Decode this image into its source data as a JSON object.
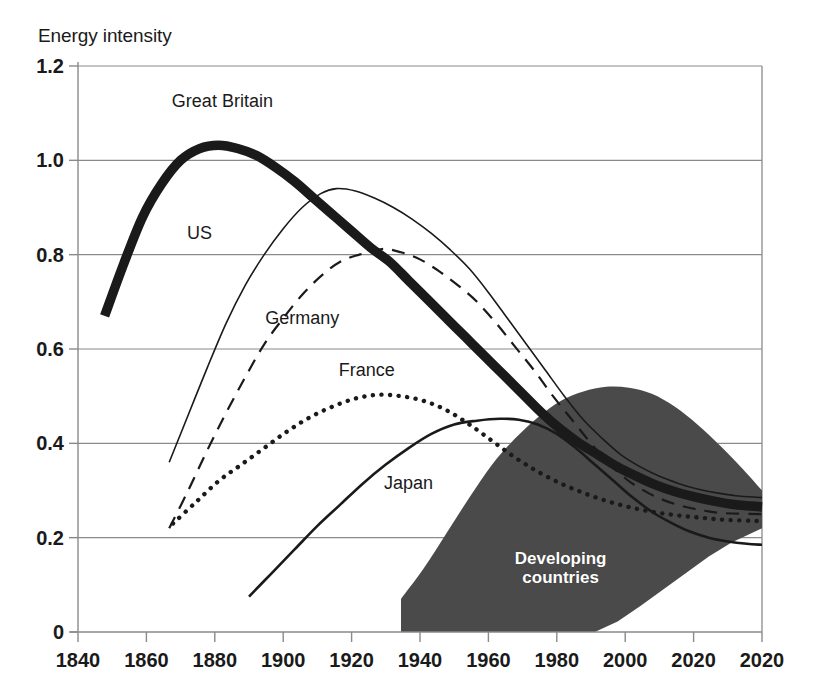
{
  "axes": {
    "y_axis_title": "Energy intensity",
    "y_ticks": [
      "1.2",
      "1.0",
      "0.8",
      "0.6",
      "0.4",
      "0.2",
      "0"
    ],
    "x_ticks": [
      "1840",
      "1860",
      "1880",
      "1900",
      "1920",
      "1940",
      "1960",
      "1980",
      "2000",
      "2020",
      "2020"
    ]
  },
  "labels": {
    "great_britain": "Great Britain",
    "us": "US",
    "germany": "Germany",
    "france": "France",
    "japan": "Japan",
    "developing": "Developing\ncountries"
  },
  "colors": {
    "ink": "#1a1a1a",
    "grid": "#8a8a8a",
    "band_fill": "#4a4a4a",
    "background": "#ffffff"
  },
  "chart_data": {
    "type": "line",
    "title": "",
    "subtitle": "",
    "xlabel": "",
    "ylabel": "Energy intensity",
    "xlim": [
      1840,
      2020
    ],
    "ylim": [
      0,
      1.2
    ],
    "grid": true,
    "legend_position": "inline-annotations",
    "x_ticks": [
      1840,
      1860,
      1880,
      1900,
      1920,
      1940,
      1960,
      1980,
      2000,
      2020,
      2020
    ],
    "y_ticks": [
      1.2,
      1.0,
      0.8,
      0.6,
      0.4,
      0.2,
      0
    ],
    "series": [
      {
        "name": "Great Britain",
        "style": "thick-solid",
        "label_x": 1878,
        "label_y": 1.125,
        "points": [
          [
            1847,
            0.67
          ],
          [
            1852,
            0.78
          ],
          [
            1857,
            0.88
          ],
          [
            1862,
            0.95
          ],
          [
            1867,
            1.0
          ],
          [
            1872,
            1.025
          ],
          [
            1877,
            1.032
          ],
          [
            1882,
            1.025
          ],
          [
            1887,
            1.01
          ],
          [
            1892,
            0.985
          ],
          [
            1897,
            0.955
          ],
          [
            1902,
            0.92
          ],
          [
            1907,
            0.885
          ],
          [
            1912,
            0.85
          ],
          [
            1917,
            0.815
          ],
          [
            1922,
            0.785
          ],
          [
            1927,
            0.745
          ],
          [
            1932,
            0.705
          ],
          [
            1937,
            0.665
          ],
          [
            1942,
            0.625
          ],
          [
            1947,
            0.585
          ],
          [
            1952,
            0.545
          ],
          [
            1957,
            0.505
          ],
          [
            1962,
            0.465
          ],
          [
            1967,
            0.43
          ],
          [
            1972,
            0.4
          ],
          [
            1977,
            0.375
          ],
          [
            1982,
            0.35
          ],
          [
            1987,
            0.33
          ],
          [
            1992,
            0.312
          ],
          [
            1997,
            0.298
          ],
          [
            2002,
            0.287
          ],
          [
            2007,
            0.278
          ],
          [
            2012,
            0.271
          ],
          [
            2017,
            0.267
          ],
          [
            2020,
            0.265
          ]
        ]
      },
      {
        "name": "US",
        "style": "thin-solid",
        "label_x": 1872,
        "label_y": 0.845,
        "points": [
          [
            1864,
            0.36
          ],
          [
            1869,
            0.46
          ],
          [
            1874,
            0.56
          ],
          [
            1879,
            0.655
          ],
          [
            1884,
            0.735
          ],
          [
            1889,
            0.8
          ],
          [
            1894,
            0.855
          ],
          [
            1899,
            0.9
          ],
          [
            1904,
            0.93
          ],
          [
            1908,
            0.94
          ],
          [
            1913,
            0.935
          ],
          [
            1918,
            0.92
          ],
          [
            1923,
            0.9
          ],
          [
            1928,
            0.875
          ],
          [
            1933,
            0.845
          ],
          [
            1938,
            0.81
          ],
          [
            1943,
            0.77
          ],
          [
            1948,
            0.72
          ],
          [
            1953,
            0.665
          ],
          [
            1958,
            0.61
          ],
          [
            1963,
            0.555
          ],
          [
            1968,
            0.5
          ],
          [
            1973,
            0.45
          ],
          [
            1978,
            0.41
          ],
          [
            1983,
            0.375
          ],
          [
            1988,
            0.35
          ],
          [
            1993,
            0.33
          ],
          [
            1998,
            0.315
          ],
          [
            2003,
            0.303
          ],
          [
            2008,
            0.295
          ],
          [
            2013,
            0.289
          ],
          [
            2020,
            0.285
          ]
        ]
      },
      {
        "name": "Germany",
        "style": "dashed",
        "label_x": 1899,
        "label_y": 0.665,
        "points": [
          [
            1864,
            0.22
          ],
          [
            1869,
            0.3
          ],
          [
            1874,
            0.385
          ],
          [
            1879,
            0.465
          ],
          [
            1884,
            0.54
          ],
          [
            1889,
            0.61
          ],
          [
            1894,
            0.665
          ],
          [
            1899,
            0.715
          ],
          [
            1904,
            0.755
          ],
          [
            1909,
            0.785
          ],
          [
            1914,
            0.8
          ],
          [
            1920,
            0.812
          ],
          [
            1925,
            0.805
          ],
          [
            1930,
            0.79
          ],
          [
            1935,
            0.765
          ],
          [
            1940,
            0.735
          ],
          [
            1945,
            0.7
          ],
          [
            1950,
            0.655
          ],
          [
            1955,
            0.605
          ],
          [
            1960,
            0.555
          ],
          [
            1965,
            0.5
          ],
          [
            1970,
            0.45
          ],
          [
            1975,
            0.4
          ],
          [
            1980,
            0.355
          ],
          [
            1985,
            0.32
          ],
          [
            1990,
            0.295
          ],
          [
            1995,
            0.277
          ],
          [
            2000,
            0.265
          ],
          [
            2005,
            0.257
          ],
          [
            2010,
            0.252
          ],
          [
            2020,
            0.25
          ]
        ]
      },
      {
        "name": "France",
        "style": "dotted",
        "label_x": 1916,
        "label_y": 0.555,
        "points": [
          [
            1865,
            0.23
          ],
          [
            1871,
            0.275
          ],
          [
            1877,
            0.32
          ],
          [
            1883,
            0.355
          ],
          [
            1889,
            0.39
          ],
          [
            1895,
            0.425
          ],
          [
            1901,
            0.455
          ],
          [
            1907,
            0.478
          ],
          [
            1913,
            0.495
          ],
          [
            1919,
            0.503
          ],
          [
            1925,
            0.5
          ],
          [
            1931,
            0.49
          ],
          [
            1937,
            0.47
          ],
          [
            1943,
            0.44
          ],
          [
            1949,
            0.405
          ],
          [
            1955,
            0.37
          ],
          [
            1961,
            0.34
          ],
          [
            1967,
            0.315
          ],
          [
            1973,
            0.295
          ],
          [
            1979,
            0.278
          ],
          [
            1985,
            0.265
          ],
          [
            1991,
            0.255
          ],
          [
            1997,
            0.248
          ],
          [
            2003,
            0.243
          ],
          [
            2010,
            0.238
          ],
          [
            2020,
            0.235
          ]
        ]
      },
      {
        "name": "Japan",
        "style": "medium-solid",
        "label_x": 1927,
        "label_y": 0.315,
        "points": [
          [
            1885,
            0.075
          ],
          [
            1891,
            0.125
          ],
          [
            1897,
            0.175
          ],
          [
            1903,
            0.225
          ],
          [
            1909,
            0.27
          ],
          [
            1915,
            0.315
          ],
          [
            1921,
            0.355
          ],
          [
            1927,
            0.39
          ],
          [
            1933,
            0.42
          ],
          [
            1939,
            0.44
          ],
          [
            1945,
            0.448
          ],
          [
            1951,
            0.452
          ],
          [
            1956,
            0.45
          ],
          [
            1961,
            0.44
          ],
          [
            1966,
            0.42
          ],
          [
            1971,
            0.39
          ],
          [
            1976,
            0.355
          ],
          [
            1981,
            0.32
          ],
          [
            1986,
            0.285
          ],
          [
            1991,
            0.255
          ],
          [
            1996,
            0.232
          ],
          [
            2001,
            0.213
          ],
          [
            2006,
            0.2
          ],
          [
            2011,
            0.192
          ],
          [
            2016,
            0.187
          ],
          [
            2020,
            0.185
          ]
        ]
      }
    ],
    "band": {
      "name": "Developing countries",
      "fill": "#4a4a4a",
      "label_x": 1967,
      "label_y": 0.135,
      "upper": [
        [
          1925,
          0.07
        ],
        [
          1931,
          0.135
        ],
        [
          1937,
          0.21
        ],
        [
          1943,
          0.285
        ],
        [
          1949,
          0.355
        ],
        [
          1955,
          0.41
        ],
        [
          1961,
          0.455
        ],
        [
          1967,
          0.49
        ],
        [
          1973,
          0.51
        ],
        [
          1979,
          0.52
        ],
        [
          1985,
          0.518
        ],
        [
          1991,
          0.505
        ],
        [
          1997,
          0.478
        ],
        [
          2003,
          0.44
        ],
        [
          2009,
          0.395
        ],
        [
          2015,
          0.345
        ],
        [
          2020,
          0.3
        ]
      ],
      "lower": [
        [
          1925,
          0.0
        ],
        [
          1940,
          0.0
        ],
        [
          1955,
          0.0
        ],
        [
          1970,
          0.0
        ],
        [
          1976,
          0.0
        ],
        [
          1982,
          0.022
        ],
        [
          1988,
          0.055
        ],
        [
          1994,
          0.09
        ],
        [
          2000,
          0.125
        ],
        [
          2006,
          0.16
        ],
        [
          2012,
          0.19
        ],
        [
          2020,
          0.22
        ]
      ]
    }
  }
}
